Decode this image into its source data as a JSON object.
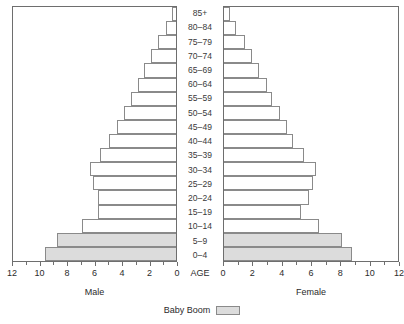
{
  "chart_data": {
    "type": "bar",
    "title": "",
    "subtitle": "",
    "orientation": "horizontal-diverging",
    "categories": [
      "0-4",
      "5-9",
      "10-14",
      "15-19",
      "20-24",
      "25-29",
      "30-34",
      "35-39",
      "40-44",
      "45-49",
      "50-54",
      "55-59",
      "60-64",
      "65-69",
      "70-74",
      "75-79",
      "80-84",
      "85+"
    ],
    "center_axis_label": "AGE",
    "xlabel": "",
    "ylabel": "",
    "xlim": [
      0,
      12
    ],
    "grid": false,
    "legend_position": "bottom-center",
    "legend": [
      {
        "name": "Baby Boom",
        "color": "#dcdcdc"
      }
    ],
    "highlight_categories": [
      "0-4",
      "5-9"
    ],
    "series": [
      {
        "name": "Male",
        "side": "left",
        "axis_ticks": [
          12,
          10,
          8,
          6,
          4,
          2,
          0
        ],
        "values": [
          9.7,
          8.8,
          7.0,
          5.8,
          5.8,
          6.2,
          6.4,
          5.7,
          5.0,
          4.4,
          3.9,
          3.4,
          2.9,
          2.4,
          1.9,
          1.4,
          0.8,
          0.4
        ]
      },
      {
        "name": "Female",
        "side": "right",
        "axis_ticks": [
          0,
          2,
          4,
          6,
          8,
          10,
          12
        ],
        "values": [
          8.9,
          8.2,
          6.6,
          5.4,
          5.9,
          6.2,
          6.4,
          5.6,
          4.8,
          4.4,
          3.9,
          3.4,
          3.0,
          2.5,
          2.0,
          1.5,
          0.9,
          0.5
        ]
      }
    ]
  },
  "axes": {
    "male": {
      "title": "Male",
      "tick_labels": [
        "12",
        "10",
        "8",
        "6",
        "4",
        "2",
        "0"
      ],
      "tick_values": [
        12,
        10,
        8,
        6,
        4,
        2,
        0
      ],
      "minor_step": 1,
      "max": 12
    },
    "female": {
      "title": "Female",
      "tick_labels": [
        "0",
        "2",
        "4",
        "6",
        "8",
        "10",
        "12"
      ],
      "tick_values": [
        0,
        2,
        4,
        6,
        8,
        10,
        12
      ],
      "minor_step": 1,
      "max": 12
    },
    "center": {
      "label": "AGE"
    }
  },
  "legend": {
    "label": "Baby Boom",
    "swatch_color": "#dcdcdc"
  },
  "colors": {
    "bar_fill": "#ffffff",
    "bar_stroke": "#8a8a8a",
    "boom_fill": "#dcdcdc",
    "panel_border": "#6e6e6e",
    "text": "#2b2b2b",
    "background": "#ffffff"
  }
}
